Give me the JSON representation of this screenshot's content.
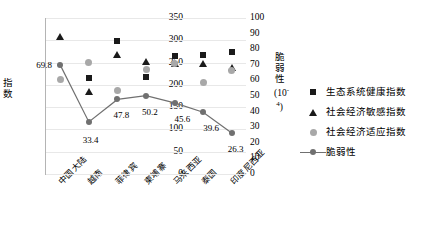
{
  "chart_data": {
    "type": "scatter",
    "title": "",
    "xlabel": "",
    "ylabel": "指数",
    "y2label": "脆弱性(10",
    "y2label_sup": "-4",
    "y2label_suffix": ")",
    "categories": [
      "中国大陆",
      "越南",
      "菲律宾",
      "柬埔寨",
      "马来西亚",
      "泰国",
      "印度尼西亚"
    ],
    "ylim": [
      0,
      350
    ],
    "yticks": [
      350,
      300,
      250,
      200,
      150,
      100,
      50,
      0
    ],
    "y2lim": [
      0,
      100
    ],
    "y2ticks": [
      100,
      90,
      80,
      70,
      60,
      50,
      40,
      30,
      20,
      10,
      0
    ],
    "grid": true,
    "legend_position": "right",
    "series": [
      {
        "name": "生态系统健康指数",
        "marker": "square",
        "color": "#1a1a1a",
        "axis": "left",
        "values": [
          null,
          216,
          298,
          217,
          264,
          267,
          273
        ]
      },
      {
        "name": "社会经济敏感指数",
        "marker": "triangle",
        "color": "#1a1a1a",
        "axis": "left",
        "values": [
          308,
          183,
          268,
          251,
          247,
          247,
          238
        ]
      },
      {
        "name": "社会经济适应指数",
        "marker": "circle",
        "color": "#a8a8a8",
        "axis": "left",
        "values": [
          212,
          250,
          188,
          234,
          248,
          205,
          233
        ]
      },
      {
        "name": "脆弱性",
        "marker": "line",
        "color": "#707070",
        "axis": "right",
        "values": [
          69.8,
          33.4,
          47.8,
          50.2,
          45.6,
          39.6,
          26.3
        ],
        "point_labels": [
          "69.8",
          "33.4",
          "47.8",
          "50.2",
          "45.6",
          "39.6",
          "26.3"
        ]
      }
    ]
  },
  "legend": {
    "items": [
      {
        "label": "生态系统健康指数",
        "marker": "square-marker"
      },
      {
        "label": "社会经济敏感指数",
        "marker": "triangle-marker"
      },
      {
        "label": "社会经济适应指数",
        "marker": "circle-marker"
      },
      {
        "label": "脆弱性",
        "marker": "line-marker"
      }
    ]
  }
}
